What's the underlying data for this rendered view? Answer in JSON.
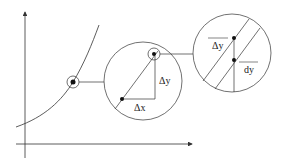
{
  "diagram": {
    "labels": {
      "delta_x": "Δx",
      "delta_y": "Δy",
      "delta_y_zoom": "Δy",
      "dy": "dy"
    },
    "colors": {
      "stroke": "#333333",
      "background": "#ffffff"
    }
  }
}
